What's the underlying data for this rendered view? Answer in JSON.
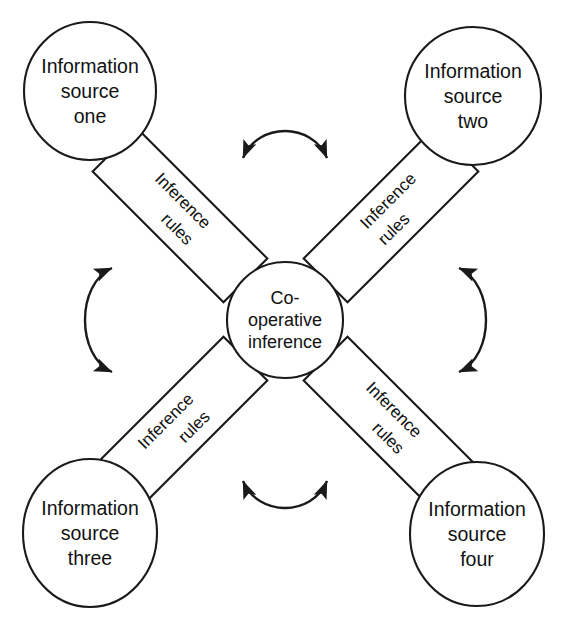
{
  "diagram": {
    "canvas": {
      "width": 561,
      "height": 636,
      "background": "#ffffff"
    },
    "stroke_color": "#1a1a1a",
    "text_color": "#111111",
    "center": {
      "name": "co-operative-inference",
      "line1": "Co-",
      "line2": "operative",
      "line3": "inference",
      "shape": "circle",
      "cx": 285,
      "cy": 320,
      "r": 58
    },
    "sources": [
      {
        "id": "source-one",
        "line1": "Information",
        "line2": "source",
        "line3": "one",
        "shape": "ellipse",
        "cx": 90,
        "cy": 91,
        "rx": 66,
        "ry": 69
      },
      {
        "id": "source-two",
        "line1": "Information",
        "line2": "source",
        "line3": "two",
        "shape": "ellipse",
        "cx": 473,
        "cy": 96,
        "rx": 68,
        "ry": 69
      },
      {
        "id": "source-three",
        "line1": "Information",
        "line2": "source",
        "line3": "three",
        "shape": "ellipse",
        "cx": 90,
        "cy": 533,
        "rx": 67,
        "ry": 74
      },
      {
        "id": "source-four",
        "line1": "Information",
        "line2": "source",
        "line3": "four",
        "shape": "ellipse",
        "cx": 477,
        "cy": 534,
        "rx": 67,
        "ry": 72
      }
    ],
    "rule_boxes": [
      {
        "id": "inference-rules-top-left",
        "line1": "Inference",
        "line2": "rules",
        "cx": 180,
        "cy": 215,
        "width": 185,
        "height": 62,
        "rotation": 45
      },
      {
        "id": "inference-rules-top-right",
        "line1": "Inference",
        "line2": "rules",
        "cx": 391,
        "cy": 215,
        "width": 185,
        "height": 62,
        "rotation": -45
      },
      {
        "id": "inference-rules-bottom-left",
        "line1": "Inference",
        "line2": "rules",
        "cx": 180,
        "cy": 424,
        "width": 185,
        "height": 62,
        "rotation": -45
      },
      {
        "id": "inference-rules-bottom-right",
        "line1": "Inference",
        "line2": "rules",
        "cx": 391,
        "cy": 424,
        "width": 185,
        "height": 62,
        "rotation": 45
      }
    ],
    "connections": [
      {
        "id": "source-one-to-rules",
        "from": "source-one",
        "to": "inference-rules-top-left",
        "style": "double-arrow-straight"
      },
      {
        "id": "source-two-to-rules",
        "from": "source-two",
        "to": "inference-rules-top-right",
        "style": "double-arrow-straight"
      },
      {
        "id": "source-three-to-rules",
        "from": "source-three",
        "to": "inference-rules-bottom-left",
        "style": "double-arrow-straight"
      },
      {
        "id": "source-four-to-rules",
        "from": "source-four",
        "to": "inference-rules-bottom-right",
        "style": "double-arrow-straight"
      },
      {
        "id": "rules-top-left-to-center",
        "from": "inference-rules-top-left",
        "to": "co-operative-inference",
        "style": "double-arrow-straight"
      },
      {
        "id": "rules-top-right-to-center",
        "from": "inference-rules-top-right",
        "to": "co-operative-inference",
        "style": "double-arrow-straight"
      },
      {
        "id": "rules-bottom-left-to-center",
        "from": "inference-rules-bottom-left",
        "to": "co-operative-inference",
        "style": "double-arrow-straight"
      },
      {
        "id": "rules-bottom-right-to-center",
        "from": "inference-rules-bottom-right",
        "to": "co-operative-inference",
        "style": "double-arrow-straight"
      },
      {
        "id": "arc-top",
        "from": "inference-rules-top-left",
        "to": "inference-rules-top-right",
        "style": "double-arrow-curved"
      },
      {
        "id": "arc-left",
        "from": "inference-rules-top-left",
        "to": "inference-rules-bottom-left",
        "style": "double-arrow-curved"
      },
      {
        "id": "arc-right",
        "from": "inference-rules-top-right",
        "to": "inference-rules-bottom-right",
        "style": "double-arrow-curved"
      },
      {
        "id": "arc-bottom",
        "from": "inference-rules-bottom-left",
        "to": "inference-rules-bottom-right",
        "style": "double-arrow-curved"
      }
    ]
  }
}
